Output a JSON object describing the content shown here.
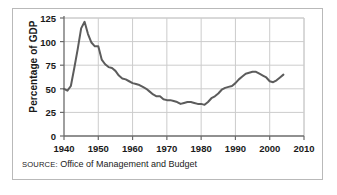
{
  "figure": {
    "source_prefix": "SOURCE:",
    "source_text": " Office of Management and Budget",
    "border_color": "#b9b9b9",
    "background": "#ffffff"
  },
  "chart_data": {
    "type": "line",
    "title": "",
    "xlabel": "",
    "ylabel": "Percentage of GDP",
    "xlim": [
      1940,
      2010
    ],
    "ylim": [
      0,
      125
    ],
    "grid": true,
    "legend": "none",
    "line_color": "#5c5c5c",
    "grid_color": "#cccccc",
    "axis_color": "#6b6b6b",
    "xticks": [
      1940,
      1950,
      1960,
      1970,
      1980,
      1990,
      2000,
      2010
    ],
    "yticks": [
      0,
      25,
      50,
      75,
      100,
      125
    ],
    "series": [
      {
        "name": "Federal debt as percentage of GDP",
        "x": [
          1940,
          1941,
          1942,
          1943,
          1944,
          1945,
          1946,
          1947,
          1948,
          1949,
          1950,
          1951,
          1952,
          1953,
          1954,
          1955,
          1956,
          1957,
          1958,
          1959,
          1960,
          1961,
          1962,
          1963,
          1964,
          1965,
          1966,
          1967,
          1968,
          1969,
          1970,
          1971,
          1972,
          1973,
          1974,
          1975,
          1976,
          1977,
          1978,
          1979,
          1980,
          1981,
          1982,
          1983,
          1984,
          1985,
          1986,
          1987,
          1988,
          1989,
          1990,
          1991,
          1992,
          1993,
          1994,
          1995,
          1996,
          1997,
          1998,
          1999,
          2000,
          2001,
          2002,
          2003,
          2004
        ],
        "values": [
          50,
          48,
          53,
          72,
          92,
          114,
          121,
          108,
          99,
          95,
          95,
          81,
          76,
          73,
          72,
          69,
          64,
          61,
          60,
          58,
          56,
          55,
          54,
          52,
          50,
          47,
          44,
          42,
          42,
          39,
          38,
          38,
          37,
          36,
          34,
          35,
          36,
          36,
          35,
          34,
          34,
          33,
          36,
          40,
          42,
          45,
          49,
          51,
          52,
          53,
          56,
          60,
          63,
          66,
          67,
          68,
          68,
          66,
          64,
          62,
          58,
          57,
          59,
          62,
          65
        ]
      }
    ]
  }
}
